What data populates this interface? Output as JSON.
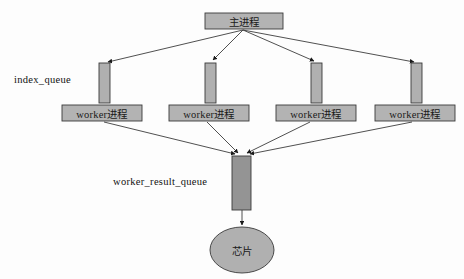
{
  "diagram": {
    "type": "flow-diagram",
    "canvas": {
      "width": 464,
      "height": 279,
      "background": "#fdfdfd"
    },
    "colors": {
      "node_fill": "#b3b3b3",
      "node_stroke": "#3a3a3a",
      "queue_fill": "#b0b0b0",
      "result_queue_fill": "#949494",
      "ellipse_fill": "#b0b0b0",
      "edge_stroke": "#3c3c3c",
      "text": "#111111"
    },
    "main_process": {
      "label": "主进程",
      "x": 205,
      "y": 13,
      "width": 78,
      "height": 16
    },
    "group_labels": [
      {
        "name": "index-queue-label",
        "text": "index_queue",
        "x": 14,
        "y": 74
      },
      {
        "name": "worker-result-queue-label",
        "text": "worker_result_queue",
        "x": 113,
        "y": 176
      }
    ],
    "index_queues": [
      {
        "label": "",
        "x": 99,
        "y": 63,
        "width": 11,
        "height": 40
      },
      {
        "label": "",
        "x": 205,
        "y": 63,
        "width": 11,
        "height": 40
      },
      {
        "label": "",
        "x": 311,
        "y": 63,
        "width": 11,
        "height": 40
      },
      {
        "label": "",
        "x": 411,
        "y": 63,
        "width": 11,
        "height": 40
      }
    ],
    "workers": [
      {
        "label": "worker进程",
        "x": 62,
        "y": 105,
        "width": 80,
        "height": 16
      },
      {
        "label": "worker进程",
        "x": 169,
        "y": 105,
        "width": 80,
        "height": 16
      },
      {
        "label": "worker进程",
        "x": 276,
        "y": 105,
        "width": 80,
        "height": 16
      },
      {
        "label": "worker进程",
        "x": 375,
        "y": 105,
        "width": 80,
        "height": 16
      }
    ],
    "result_queue": {
      "label": "",
      "x": 232,
      "y": 156,
      "width": 19,
      "height": 54
    },
    "sink": {
      "label": "芯片",
      "cx": 242,
      "cy": 250,
      "rx": 32,
      "ry": 23
    },
    "edges": [
      {
        "from": "main-process",
        "to": "index-queue-1",
        "path": "M 243 30 L 107 62"
      },
      {
        "from": "main-process",
        "to": "index-queue-2",
        "path": "M 243 30 L 212 60"
      },
      {
        "from": "main-process",
        "to": "index-queue-3",
        "path": "M 243 30 L 315 61"
      },
      {
        "from": "main-process",
        "to": "index-queue-4",
        "path": "M 243 30 L 414 62"
      },
      {
        "from": "worker-1",
        "to": "result-queue",
        "path": "M 104 122 L 234 155"
      },
      {
        "from": "worker-2",
        "to": "result-queue",
        "path": "M 207 122 L 238 154"
      },
      {
        "from": "worker-3",
        "to": "result-queue",
        "path": "M 310 122 L 248 154"
      },
      {
        "from": "worker-4",
        "to": "result-queue",
        "path": "M 412 122 L 252 155"
      },
      {
        "from": "result-queue",
        "to": "sink",
        "path": "M 242 210 L 242 226"
      }
    ]
  }
}
